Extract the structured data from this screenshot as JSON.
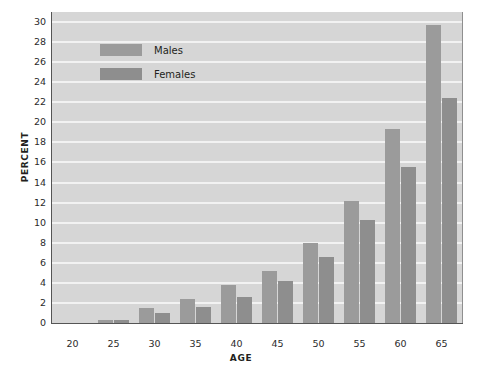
{
  "chart_data": {
    "type": "bar",
    "title": "",
    "xlabel": "AGE",
    "ylabel": "PERCENT",
    "categories": [
      "20",
      "25",
      "30",
      "35",
      "40",
      "45",
      "50",
      "55",
      "60",
      "65"
    ],
    "series": [
      {
        "name": "Males",
        "color": "#9b9b9b",
        "values": [
          0,
          0.3,
          1.5,
          2.4,
          3.8,
          5.2,
          8.0,
          12.2,
          19.3,
          29.7
        ]
      },
      {
        "name": "Females",
        "color": "#8e8e8e",
        "values": [
          0,
          0.3,
          1.0,
          1.6,
          2.6,
          4.2,
          6.6,
          10.3,
          15.6,
          22.4
        ]
      }
    ],
    "ylim": [
      0,
      31
    ],
    "xlim": [
      17.5,
      67.5
    ],
    "y_ticks": [
      0,
      2,
      4,
      6,
      8,
      10,
      12,
      14,
      16,
      18,
      20,
      22,
      24,
      26,
      28,
      30
    ],
    "x_ticks": [
      "20",
      "25",
      "30",
      "35",
      "40",
      "45",
      "50",
      "55",
      "60",
      "65"
    ],
    "grid": "horizontal",
    "grid_color": "#f2f2f2",
    "plot_background": "#d6d6d6",
    "legend_position": "top-left-inside"
  },
  "legend": {
    "items": [
      {
        "label": "Males"
      },
      {
        "label": "Females"
      }
    ]
  },
  "axes": {
    "y_title": "PERCENT",
    "x_title": "AGE"
  }
}
